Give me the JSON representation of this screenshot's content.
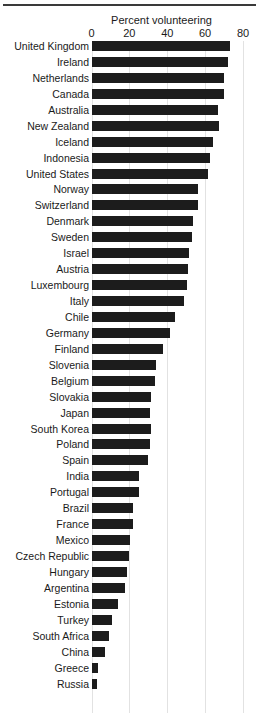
{
  "chart_data": {
    "type": "bar",
    "orientation": "horizontal",
    "title": "",
    "xlabel": "Percent volunteering",
    "ylabel": "",
    "xlim": [
      0,
      80
    ],
    "xticks": [
      0,
      20,
      40,
      60,
      80
    ],
    "xtick_labels": [
      "0",
      "20",
      "40",
      "60",
      "80"
    ],
    "grid": true,
    "grid_axis": "x",
    "legend": null,
    "bar_color": "#1c1c1c",
    "background_color": "#ffffff",
    "sorted": "descending",
    "categories": [
      "United Kingdom",
      "Ireland",
      "Netherlands",
      "Canada",
      "Australia",
      "New Zealand",
      "Iceland",
      "Indonesia",
      "United States",
      "Norway",
      "Switzerland",
      "Denmark",
      "Sweden",
      "Israel",
      "Austria",
      "Luxembourg",
      "Italy",
      "Chile",
      "Germany",
      "Finland",
      "Slovenia",
      "Belgium",
      "Slovakia",
      "Japan",
      "South Korea",
      "Poland",
      "Spain",
      "India",
      "Portugal",
      "Brazil",
      "France",
      "Mexico",
      "Czech Republic",
      "Hungary",
      "Argentina",
      "Estonia",
      "Turkey",
      "South Africa",
      "China",
      "Greece",
      "Russia"
    ],
    "values": [
      73,
      72,
      70,
      70,
      67,
      67.5,
      64,
      62.5,
      61.5,
      56,
      56,
      53.5,
      53,
      51.5,
      51,
      50.5,
      49,
      44,
      41.5,
      38,
      34,
      33.5,
      31.5,
      31,
      31.5,
      31,
      30,
      25,
      25,
      22,
      22,
      20.5,
      20,
      19,
      17.5,
      14,
      11,
      9.5,
      7,
      3.5,
      3
    ]
  },
  "axis": {
    "title": "Percent volunteering"
  }
}
